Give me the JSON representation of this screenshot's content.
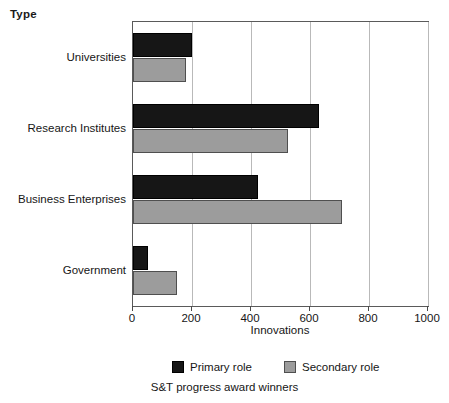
{
  "axis_group_title": "Type",
  "caption": "S&T progress award winners",
  "colors": {
    "primary": "#161616",
    "secondary": "#9c9c9c",
    "frame": "#5a5a5a",
    "grid": "#b9b9b9",
    "background": "#ffffff"
  },
  "legend": {
    "entries": [
      {
        "label": "Primary role",
        "swatch": "primary"
      },
      {
        "label": "Secondary role",
        "swatch": "secondary"
      }
    ]
  },
  "chart_data": {
    "type": "bar",
    "orientation": "horizontal",
    "title": "",
    "subtitle": "S&T progress award winners",
    "xlabel": "Innovations",
    "ylabel": "Type",
    "categories": [
      "Universities",
      "Research Institutes",
      "Business Enterprises",
      "Government"
    ],
    "series": [
      {
        "name": "Primary role",
        "values": [
          200,
          630,
          425,
          50
        ]
      },
      {
        "name": "Secondary role",
        "values": [
          180,
          525,
          710,
          150
        ]
      }
    ],
    "xlim": [
      0,
      1000
    ],
    "xticks": [
      0,
      200,
      400,
      600,
      800,
      1000
    ],
    "xtick_labels": [
      "0",
      "200",
      "400",
      "600",
      "800",
      "1000"
    ],
    "grid": "vertical",
    "legend_position": "bottom"
  }
}
